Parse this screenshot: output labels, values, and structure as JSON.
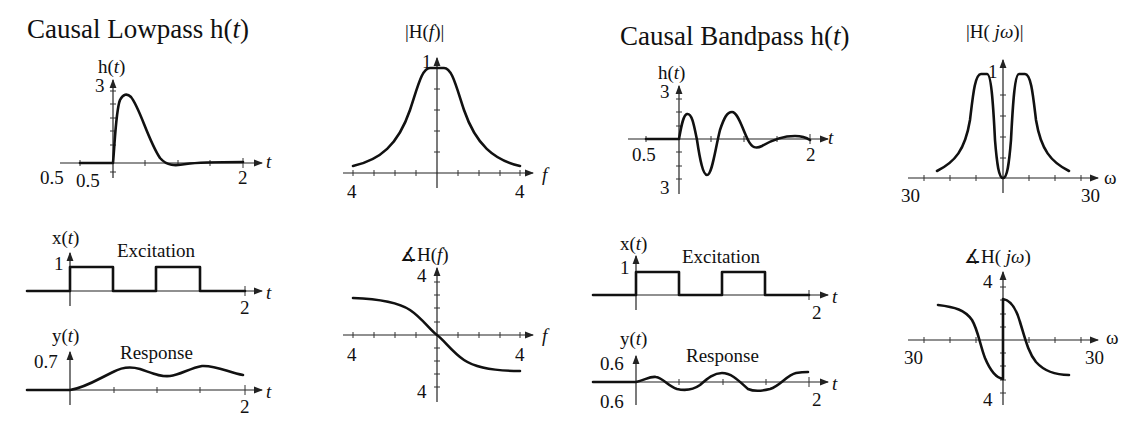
{
  "titles": {
    "lowpass": "Causal Lowpass h(t)",
    "lowpass_main": "Causal Lowpass h(",
    "bandpass_main": "Causal Bandpass h(",
    "t_var": "t",
    "close_paren": ")"
  },
  "panels": {
    "lp_impulse": {
      "ylabel_pre": "h(",
      "ylabel_var": "t",
      "ylabel_post": ")",
      "ymax": "3",
      "xmin_left": "0.5",
      "ymin": "0.5",
      "xmax": "2",
      "xvar": "t"
    },
    "lp_mag": {
      "ylabel": "|H(",
      "ylabel_var": "f",
      "ylabel_post": ")|",
      "ymax": "1",
      "xmin": "4",
      "xmax": "4",
      "xvar": "f"
    },
    "lp_exc": {
      "ylabel_pre": "x(",
      "ylabel_var": "t",
      "ylabel_post": ")",
      "ymax": "1",
      "caption": "Excitation",
      "xmax": "2",
      "xvar": "t"
    },
    "lp_resp": {
      "ylabel_pre": "y(",
      "ylabel_var": "t",
      "ylabel_post": ")",
      "ymax": "0.7",
      "caption": "Response",
      "xmax": "2",
      "xvar": "t"
    },
    "lp_phase": {
      "ylabel_pre": "∡H(",
      "ylabel_var": "f",
      "ylabel_post": ")",
      "ymax": "4",
      "ymin": "4",
      "xmin": "4",
      "xmax": "4",
      "xvar": "f"
    },
    "bp_impulse": {
      "ylabel_pre": "h(",
      "ylabel_var": "t",
      "ylabel_post": ")",
      "ymax": "3",
      "ymin": "3",
      "xmin": "0.5",
      "xmax": "2",
      "xvar": "t"
    },
    "bp_mag": {
      "ylabel_pre": "|H( ",
      "ylabel_var": "jω",
      "ylabel_post": ")|",
      "ymax": "1",
      "xmin": "30",
      "xmax": "30",
      "xvar": "ω"
    },
    "bp_exc": {
      "ylabel_pre": "x(",
      "ylabel_var": "t",
      "ylabel_post": ")",
      "ymax": "1",
      "caption": "Excitation",
      "xmax": "2",
      "xvar": "t"
    },
    "bp_resp": {
      "ylabel_pre": "y(",
      "ylabel_var": "t",
      "ylabel_post": ")",
      "ymax": "0.6",
      "ymin": "0.6",
      "caption": "Response",
      "xmax": "2",
      "xvar": "t"
    },
    "bp_phase": {
      "ylabel_pre": "∡H( ",
      "ylabel_var": "jω",
      "ylabel_post": ")",
      "ymax": "4",
      "ymin": "4",
      "xmin": "30",
      "xmax": "30",
      "xvar": "ω"
    }
  },
  "colors": {
    "ink": "#111111",
    "background": "#ffffff"
  }
}
